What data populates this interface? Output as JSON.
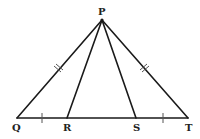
{
  "diagram": {
    "type": "geometry",
    "points": {
      "P": {
        "label": "P",
        "x": 102,
        "y": 20
      },
      "Q": {
        "label": "Q",
        "x": 17,
        "y": 118
      },
      "R": {
        "label": "R",
        "x": 67,
        "y": 118
      },
      "S": {
        "label": "S",
        "x": 136,
        "y": 118
      },
      "T": {
        "label": "T",
        "x": 188,
        "y": 118
      }
    },
    "segments": [
      "PQ",
      "PR",
      "PS",
      "PT",
      "QT"
    ],
    "equal_marks": {
      "double": [
        "PQ",
        "PT"
      ],
      "single": [
        "QR",
        "ST"
      ]
    },
    "colors": {
      "stroke": "#1a1a1a",
      "background": "#ffffff"
    }
  }
}
